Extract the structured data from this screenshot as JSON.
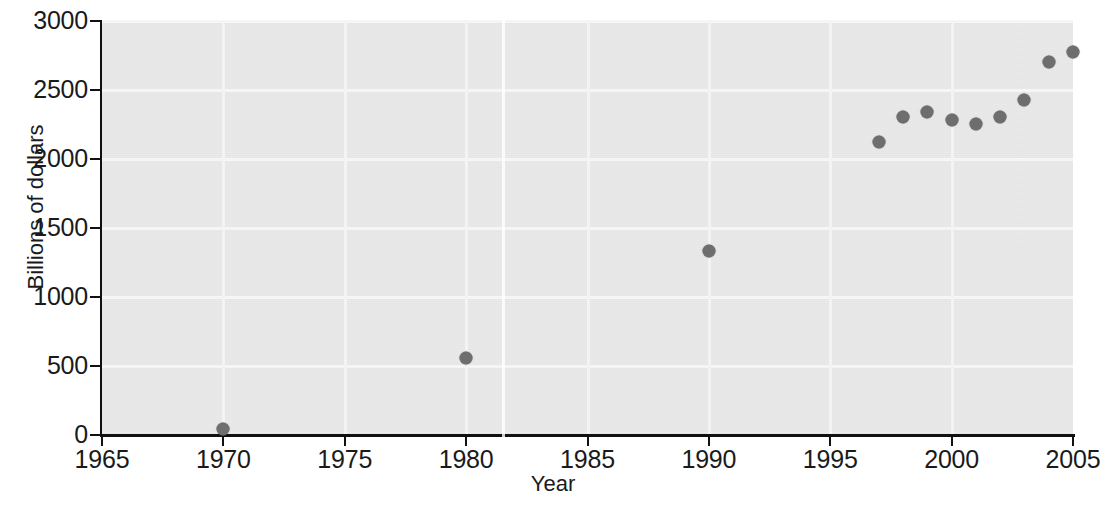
{
  "chart_data": {
    "type": "scatter",
    "title": "",
    "xlabel": "Year",
    "ylabel": "Billions of dollars",
    "xlim": [
      1965,
      2005
    ],
    "ylim": [
      0,
      3000
    ],
    "xticks": [
      1965,
      1970,
      1975,
      1980,
      1985,
      1990,
      1995,
      2000,
      2005
    ],
    "xtick_labels": [
      "1965",
      "1970",
      "1975",
      "1980",
      "1985",
      "1990",
      "1995",
      "2000",
      "2005"
    ],
    "yticks": [
      0,
      500,
      1000,
      1500,
      2000,
      2500,
      3000
    ],
    "ytick_labels": [
      "0",
      "500",
      "1000",
      "1500",
      "2000",
      "2500",
      "3000"
    ],
    "grid": true,
    "grid_color": "#f7f7f7",
    "plot_background": "#e9e9e9",
    "marker_color": "#6e6e6e",
    "legend": null,
    "series": [
      {
        "name": "",
        "x": [
          1970,
          1980,
          1990,
          1997,
          1998,
          1999,
          2000,
          2001,
          2002,
          2003,
          2004,
          2005
        ],
        "y": [
          40,
          555,
          1330,
          2125,
          2305,
          2340,
          2285,
          2255,
          2305,
          2430,
          2705,
          2775
        ]
      }
    ]
  }
}
